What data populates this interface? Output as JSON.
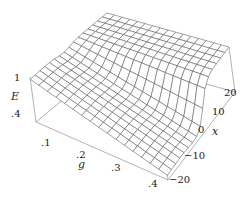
{
  "chart_data": {
    "type": "surface3d",
    "title": "",
    "axes": {
      "g": {
        "label": "g",
        "ticks": [
          ".1",
          ".2",
          ".3",
          ".4"
        ],
        "range": [
          0.05,
          0.4
        ]
      },
      "x": {
        "label": "x",
        "ticks": [
          "−20",
          "−10",
          "0",
          "10",
          "20"
        ],
        "range": [
          -20,
          20
        ]
      },
      "E": {
        "label": "E",
        "ticks": [
          ".4",
          "1"
        ],
        "range": [
          0.4,
          1.0
        ]
      }
    },
    "grid": {
      "g_lines": 16,
      "x_lines": 16
    },
    "surface_samples": {
      "g": [
        0.05,
        0.1,
        0.2,
        0.3,
        0.4
      ],
      "x": [
        -20,
        -10,
        0,
        10,
        20
      ],
      "E": [
        [
          1.0,
          0.98,
          0.9,
          1.0,
          1.0
        ],
        [
          0.95,
          0.92,
          0.85,
          1.0,
          1.0
        ],
        [
          0.85,
          0.8,
          0.72,
          1.0,
          1.0
        ],
        [
          0.72,
          0.68,
          0.6,
          1.0,
          1.0
        ],
        [
          0.6,
          0.56,
          0.48,
          1.0,
          1.0
        ]
      ]
    },
    "stroke_color": "#555555",
    "background": "#ffffff"
  },
  "labels": {
    "E_axis": "E",
    "g_axis": "g",
    "x_axis": "x",
    "E_ticks": [
      {
        "text": "1",
        "x": 14,
        "y": 81
      },
      {
        "text": ".4",
        "x": 11,
        "y": 117
      }
    ],
    "g_ticks": [
      {
        "text": ".1",
        "x": 41,
        "y": 146
      },
      {
        "text": ".2",
        "x": 76,
        "y": 158
      },
      {
        "text": ".3",
        "x": 111,
        "y": 171
      },
      {
        "text": ".4",
        "x": 148,
        "y": 187
      }
    ],
    "x_ticks": [
      {
        "text": "20",
        "x": 224,
        "y": 96
      },
      {
        "text": "10",
        "x": 212,
        "y": 115
      },
      {
        "text": "0",
        "x": 198,
        "y": 133
      },
      {
        "text": "−10",
        "x": 184,
        "y": 159
      },
      {
        "text": "−20",
        "x": 169,
        "y": 183
      }
    ]
  }
}
